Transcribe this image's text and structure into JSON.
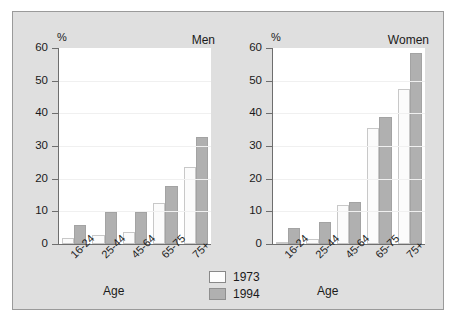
{
  "chart_data": {
    "type": "bar",
    "title": "",
    "xlabel": "Age",
    "ylabel": "%",
    "ylim": [
      0,
      60
    ],
    "yticks": [
      0,
      10,
      20,
      30,
      40,
      50,
      60
    ],
    "grid": true,
    "legend_position": "bottom-center",
    "categories": [
      "16-24",
      "25-44",
      "45-64",
      "65-75",
      "75+"
    ],
    "panels": [
      {
        "name": "Men",
        "series": [
          {
            "name": "1973",
            "values": [
              1.8,
              2.8,
              3.8,
              12.7,
              23.5
            ]
          },
          {
            "name": "1994",
            "values": [
              5.8,
              9.8,
              9.8,
              17.8,
              32.7
            ]
          }
        ]
      },
      {
        "name": "Women",
        "series": [
          {
            "name": "1973",
            "values": [
              0.7,
              1.5,
              11.9,
              35.5,
              47.6
            ]
          },
          {
            "name": "1994",
            "values": [
              4.8,
              6.8,
              12.8,
              38.8,
              58.5
            ]
          }
        ]
      }
    ],
    "colors": {
      "y1973": "#fbfbfb",
      "y1994": "#b0b0b0",
      "panel_background": "#dfdfdf",
      "plot_background": "#ffffff",
      "axis": "#6e6e6e"
    }
  },
  "legend": {
    "items": [
      {
        "label": "1973",
        "key": "y1973"
      },
      {
        "label": "1994",
        "key": "y1994"
      }
    ]
  }
}
